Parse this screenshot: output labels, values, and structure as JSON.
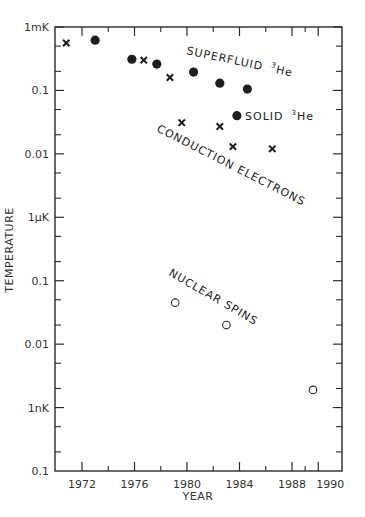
{
  "chart_data": {
    "type": "scatter",
    "title": "",
    "xlabel": "YEAR",
    "ylabel": "TEMPERATURE",
    "yscale": "log",
    "y_unit_base": "mK",
    "xlim": [
      1970,
      1991.8
    ],
    "ylim_mK": [
      1e-07,
      1
    ],
    "grid": false,
    "legend": "none (inline annotations)",
    "x_ticks": [
      {
        "value": 1972,
        "label": "1972"
      },
      {
        "value": 1976,
        "label": "1976"
      },
      {
        "value": 1980,
        "label": "1980"
      },
      {
        "value": 1984,
        "label": "1984"
      },
      {
        "value": 1988,
        "label": "1988"
      },
      {
        "value": 1990,
        "label": "1990"
      }
    ],
    "x_minor_ticks": [
      1974,
      1978,
      1982,
      1986,
      1989
    ],
    "y_ticks": [
      {
        "value_mK": 1,
        "label": "1mK"
      },
      {
        "value_mK": 0.1,
        "label": "0.1"
      },
      {
        "value_mK": 0.01,
        "label": "0.01"
      },
      {
        "value_mK": 0.001,
        "label": "1µK"
      },
      {
        "value_mK": 0.0001,
        "label": "0.1"
      },
      {
        "value_mK": 1e-05,
        "label": "0.01"
      },
      {
        "value_mK": 1e-06,
        "label": "1nK"
      },
      {
        "value_mK": 1e-07,
        "label": "0.1"
      }
    ],
    "series": [
      {
        "name": "Superfluid 3He",
        "marker": "filled-circle",
        "points": [
          {
            "year": 1973.0,
            "T_mK": 0.62
          },
          {
            "year": 1975.8,
            "T_mK": 0.31
          },
          {
            "year": 1977.7,
            "T_mK": 0.26
          },
          {
            "year": 1980.5,
            "T_mK": 0.195
          },
          {
            "year": 1982.5,
            "T_mK": 0.13
          },
          {
            "year": 1984.6,
            "T_mK": 0.105
          }
        ]
      },
      {
        "name": "Solid 3He",
        "marker": "filled-circle",
        "points": [
          {
            "year": 1983.8,
            "T_mK": 0.04
          }
        ]
      },
      {
        "name": "Conduction electrons",
        "marker": "cross",
        "points": [
          {
            "year": 1970.8,
            "T_mK": 0.56
          },
          {
            "year": 1976.7,
            "T_mK": 0.3
          },
          {
            "year": 1978.7,
            "T_mK": 0.16
          },
          {
            "year": 1979.6,
            "T_mK": 0.031
          },
          {
            "year": 1982.5,
            "T_mK": 0.027
          },
          {
            "year": 1983.5,
            "T_mK": 0.013
          },
          {
            "year": 1986.5,
            "T_mK": 0.012
          }
        ]
      },
      {
        "name": "Nuclear spins",
        "marker": "open-circle",
        "points": [
          {
            "year": 1979.1,
            "T_mK": 4.5e-05
          },
          {
            "year": 1983.0,
            "T_mK": 2e-05
          },
          {
            "year": 1989.6,
            "T_mK": 1.9e-06
          }
        ]
      }
    ],
    "annotations": [
      {
        "text": "SUPERFLUID",
        "sup": "3",
        "suffix": "He",
        "rotation_deg": 12
      },
      {
        "text": "SOLID",
        "sup": "3",
        "suffix": "He",
        "rotation_deg": 0
      },
      {
        "text": "CONDUCTION ELECTRONS",
        "rotation_deg": 27
      },
      {
        "text": "NUCLEAR SPINS",
        "rotation_deg": 30
      }
    ]
  }
}
